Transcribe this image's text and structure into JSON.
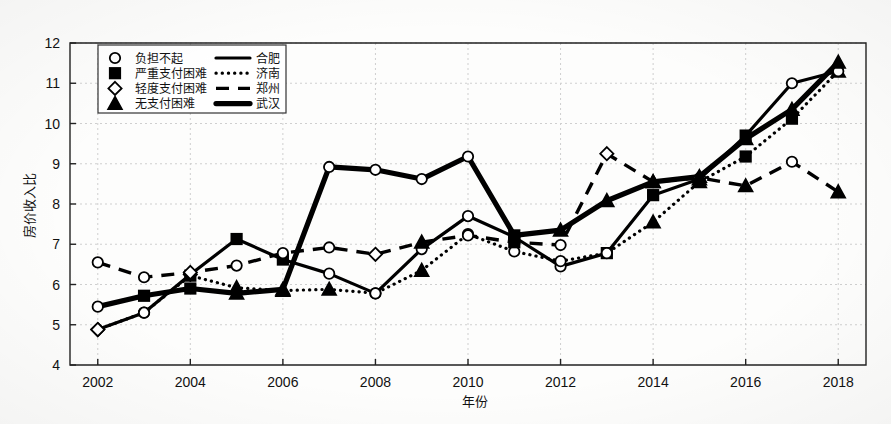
{
  "chart_data": {
    "type": "line",
    "title": "",
    "xlabel": "年份",
    "ylabel": "房价收入比",
    "xlim": [
      2001.4,
      2018.6
    ],
    "ylim": [
      4,
      12
    ],
    "grid": true,
    "x": [
      2002,
      2003,
      2004,
      2005,
      2006,
      2007,
      2008,
      2009,
      2010,
      2011,
      2012,
      2013,
      2014,
      2015,
      2016,
      2017,
      2018
    ],
    "xticks": [
      2002,
      2004,
      2006,
      2008,
      2010,
      2012,
      2014,
      2016,
      2018
    ],
    "xtick_labels": [
      "2002",
      "2004",
      "2006",
      "2008",
      "2010",
      "2012",
      "2014",
      "2016",
      "2018"
    ],
    "yticks": [
      4,
      5,
      6,
      7,
      8,
      9,
      10,
      11,
      12
    ],
    "ytick_labels": [
      "4",
      "5",
      "6",
      "7",
      "8",
      "9",
      "10",
      "11",
      "12"
    ],
    "legend_position": "upper-left",
    "marker_legend": [
      {
        "marker": "circle-open",
        "label": "负担不起"
      },
      {
        "marker": "square-filled",
        "label": "严重支付困难"
      },
      {
        "marker": "diamond-open",
        "label": "轻度支付困难"
      },
      {
        "marker": "triangle-filled",
        "label": "无支付困难"
      }
    ],
    "line_legend": [
      {
        "style": "solid",
        "label": "合肥"
      },
      {
        "style": "dotted",
        "label": "济南"
      },
      {
        "style": "dashed",
        "label": "郑州"
      },
      {
        "style": "thick-solid",
        "label": "武汉"
      }
    ],
    "series": [
      {
        "name": "合肥",
        "style": "solid",
        "values": [
          4.88,
          5.3,
          6.25,
          7.13,
          6.62,
          6.27,
          5.78,
          6.88,
          7.7,
          7.18,
          6.45,
          6.78,
          8.22,
          8.62,
          9.7,
          11.0,
          11.3
        ],
        "markers": [
          "diamond-open",
          "circle-open",
          "diamond-open",
          "square-filled",
          "square-filled",
          "circle-open",
          "circle-open",
          "circle-open",
          "circle-open",
          "circle-open",
          "circle-open",
          "square-filled",
          "square-filled",
          "triangle-filled",
          "square-filled",
          "circle-open",
          "triangle-filled"
        ]
      },
      {
        "name": "济南",
        "style": "dotted",
        "values": [
          4.88,
          5.3,
          6.22,
          5.92,
          5.85,
          5.88,
          5.78,
          6.35,
          7.25,
          6.82,
          6.58,
          6.78,
          7.55,
          8.55,
          9.18,
          10.12,
          11.3
        ],
        "markers": [
          "diamond-open",
          "circle-open",
          "square-filled",
          "triangle-filled",
          "triangle-filled",
          "triangle-filled",
          "circle-open",
          "triangle-filled",
          "circle-open",
          "circle-open",
          "circle-open",
          "circle-open",
          "triangle-filled",
          "triangle-filled",
          "square-filled",
          "square-filled",
          "circle-open"
        ]
      },
      {
        "name": "郑州",
        "style": "dashed",
        "values": [
          6.55,
          6.18,
          6.3,
          6.47,
          6.78,
          6.92,
          6.75,
          7.05,
          7.22,
          7.05,
          6.98,
          9.25,
          8.55,
          8.65,
          8.45,
          9.05,
          8.3
        ],
        "markers": [
          "circle-open",
          "circle-open",
          "diamond-open",
          "circle-open",
          "circle-open",
          "circle-open",
          "diamond-open",
          "triangle-filled",
          "circle-open",
          "square-filled",
          "circle-open",
          "diamond-open",
          "triangle-filled",
          "diamond-open",
          "triangle-filled",
          "circle-open",
          "triangle-filled"
        ]
      },
      {
        "name": "武汉",
        "style": "thick-solid",
        "values": [
          5.45,
          5.72,
          5.9,
          5.78,
          5.88,
          7.78,
          6.35,
          7.45,
          7.28,
          7.22,
          7.35,
          8.08,
          8.55,
          8.68,
          9.62,
          10.35,
          11.52
        ],
        "markers": [
          "circle-open",
          "square-filled",
          "square-filled",
          "triangle-filled",
          "triangle-filled",
          "triangle-filled",
          "triangle-filled",
          "triangle-filled",
          "square-filled",
          "square-filled",
          "triangle-filled",
          "triangle-filled",
          "triangle-filled",
          "triangle-filled",
          "triangle-filled",
          "triangle-filled",
          "triangle-filled"
        ]
      }
    ],
    "extra_points": [
      {
        "series": "武汉",
        "x": 2007,
        "y": 8.92,
        "marker": "circle-open"
      },
      {
        "series": "武汉",
        "x": 2008,
        "y": 8.85,
        "marker": "circle-open"
      },
      {
        "series": "武汉",
        "x": 2009,
        "y": 8.62,
        "marker": "circle-open"
      },
      {
        "series": "武汉",
        "x": 2010,
        "y": 9.18,
        "marker": "circle-open"
      }
    ]
  },
  "axes": {
    "ylabel": "房价收入比",
    "xlabel": "年份"
  }
}
